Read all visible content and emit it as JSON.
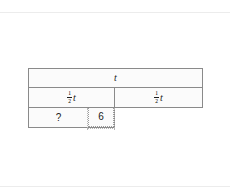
{
  "diagram": {
    "type": "tape-diagram",
    "total_label": "t",
    "rows": [
      {
        "name": "total",
        "cells": [
          {
            "label": "t",
            "kind": "variable",
            "fraction": null
          }
        ]
      },
      {
        "name": "halves",
        "cells": [
          {
            "label": "t",
            "kind": "variable",
            "fraction": {
              "numerator": "1",
              "denominator": "2"
            }
          },
          {
            "label": "t",
            "kind": "variable",
            "fraction": {
              "numerator": "1",
              "denominator": "2"
            }
          }
        ]
      },
      {
        "name": "parts",
        "cells": [
          {
            "label": "?",
            "kind": "unknown",
            "fraction": null
          },
          {
            "label": "6",
            "kind": "number",
            "fraction": null
          }
        ]
      }
    ]
  },
  "colors": {
    "stroke": "#8a8a8a",
    "dotted_stroke": "#9a9a9a",
    "fill": "#fbfbfb",
    "text": "#1b1b1b",
    "page_rule": "#ececec",
    "background": "#ffffff"
  }
}
